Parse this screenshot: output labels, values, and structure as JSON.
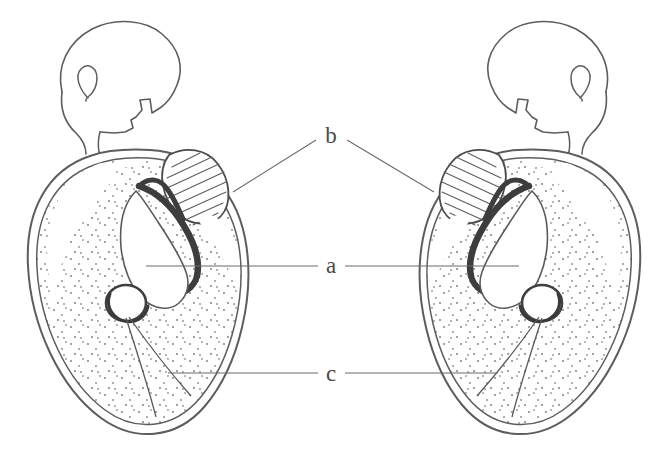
{
  "figure": {
    "background_color": "#ffffff",
    "ink_color": "#5a5a5a",
    "dark_ink_color": "#3c3c3c",
    "stipple_color": "#8a8a8a",
    "label_color": "#4a4a4a",
    "width": 668,
    "height": 451
  },
  "labels": [
    {
      "id": "label-b",
      "text": "b",
      "x": 331,
      "y": 143,
      "meaning": "hatched-structure"
    },
    {
      "id": "label-a",
      "text": "a",
      "x": 331,
      "y": 273,
      "meaning": "central-sulcus-structure"
    },
    {
      "id": "label-c",
      "text": "c",
      "x": 331,
      "y": 381,
      "meaning": "lower-wedge-segment"
    }
  ],
  "leader_lines": [
    {
      "id": "leader-b-left",
      "label": "b",
      "side": "left",
      "x1": 316,
      "y1": 140,
      "x2": 233,
      "y2": 192
    },
    {
      "id": "leader-b-right",
      "label": "b",
      "side": "right",
      "x1": 347,
      "y1": 140,
      "x2": 434,
      "y2": 192
    },
    {
      "id": "leader-a-left",
      "label": "a",
      "side": "left",
      "x1": 318,
      "y1": 266,
      "x2": 146,
      "y2": 266
    },
    {
      "id": "leader-a-right",
      "label": "a",
      "side": "right",
      "x1": 345,
      "y1": 266,
      "x2": 519,
      "y2": 266
    },
    {
      "id": "leader-c-left",
      "label": "c",
      "side": "left",
      "x1": 318,
      "y1": 373,
      "x2": 168,
      "y2": 373
    },
    {
      "id": "leader-c-right",
      "label": "c",
      "side": "right",
      "x1": 345,
      "y1": 373,
      "x2": 498,
      "y2": 373
    }
  ],
  "figures": [
    {
      "id": "left-figure",
      "name": "left-specimen",
      "head_direction": "faces-right",
      "head_label": "profile head outline with ear, nose, chin and neck",
      "section_label": "stippled oval cross-section with hatched ovoid and dark sulcus"
    },
    {
      "id": "right-figure",
      "name": "right-specimen",
      "head_direction": "faces-left",
      "head_label": "profile head outline with ear, nose, chin and neck (mirrored)",
      "section_label": "stippled oval cross-section with hatched ovoid and dark sulcus (mirrored)"
    }
  ]
}
